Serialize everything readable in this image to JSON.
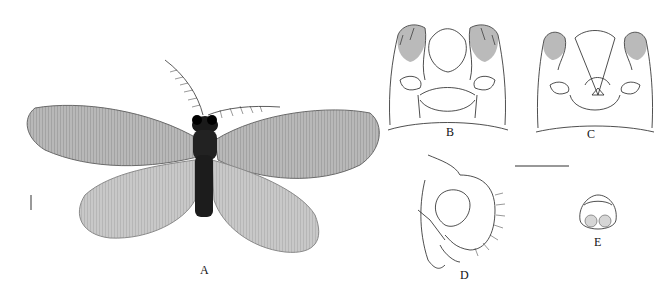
{
  "figure": {
    "panels": [
      {
        "id": "A",
        "label": "A",
        "content": "habitus photograph, dorsal view"
      },
      {
        "id": "B",
        "label": "B",
        "content": "genitalia line drawing, ventral view"
      },
      {
        "id": "C",
        "label": "C",
        "content": "genitalia line drawing, dorsal view"
      },
      {
        "id": "D",
        "label": "D",
        "content": "genitalia line drawing, lateral view"
      },
      {
        "id": "E",
        "label": "E",
        "content": "small structure line drawing"
      }
    ],
    "scale_bars": [
      {
        "panel": "A",
        "orientation": "vertical"
      },
      {
        "panel": "B-E",
        "orientation": "horizontal"
      }
    ],
    "colors": {
      "ink": "#111111",
      "wing": "#9a9a9a",
      "body": "#1a1a1a",
      "background": "#ffffff"
    }
  }
}
